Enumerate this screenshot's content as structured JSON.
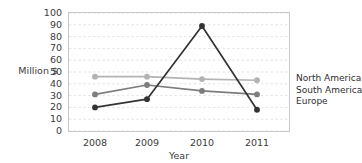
{
  "title_remnant": "",
  "axis": {
    "ylabel": "Million $",
    "xlabel": "Year",
    "yticks": [
      "100",
      "90",
      "80",
      "70",
      "60",
      "50",
      "40",
      "30",
      "20",
      "10",
      "0"
    ],
    "xticks": [
      "2008",
      "2009",
      "2010",
      "2011"
    ]
  },
  "legend": {
    "items": [
      {
        "label": "North America",
        "color": "#b3b3b3"
      },
      {
        "label": "South America",
        "color": "#7d7d7d"
      },
      {
        "label": "Europe",
        "color": "#333333"
      }
    ]
  },
  "chart_data": {
    "type": "line",
    "title": "",
    "xlabel": "Year",
    "ylabel": "Million $",
    "categories": [
      "2008",
      "2009",
      "2010",
      "2011"
    ],
    "ylim": [
      0,
      100
    ],
    "ytick_step": 10,
    "grid": "horizontal-dashed",
    "legend_position": "right",
    "markers": "filled-circle",
    "series": [
      {
        "name": "North America",
        "color": "#b3b3b3",
        "values": [
          46,
          46,
          44,
          43
        ]
      },
      {
        "name": "South America",
        "color": "#7d7d7d",
        "values": [
          31,
          39,
          34,
          31
        ]
      },
      {
        "name": "Europe",
        "color": "#333333",
        "values": [
          20,
          27,
          89,
          18
        ]
      }
    ]
  }
}
